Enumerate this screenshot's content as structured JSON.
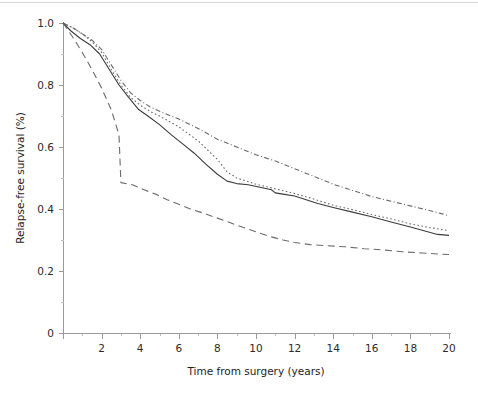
{
  "figure": {
    "background_color": "#ffffff",
    "axis_color": "#9a9a9a",
    "text_color": "#1d1d1d"
  },
  "axes": {
    "x_title": "Time from surgery (years)",
    "y_title": "Relapse-free survival (%)",
    "x_tick_labels": [
      "0",
      "2",
      "4",
      "6",
      "8",
      "10",
      "12",
      "14",
      "16",
      "18",
      "20"
    ],
    "y_tick_labels": [
      "0",
      "0.2",
      "0.4",
      "0.6",
      "0.8",
      "1.0"
    ]
  },
  "chart_data": {
    "type": "line",
    "title": "",
    "xlabel": "Time from surgery (years)",
    "ylabel": "Relapse-free survival (%)",
    "xlim": [
      0,
      20
    ],
    "ylim": [
      0,
      1.0
    ],
    "xticks": [
      0,
      2,
      4,
      6,
      8,
      10,
      12,
      14,
      16,
      18,
      20
    ],
    "yticks": [
      0,
      0.2,
      0.4,
      0.6,
      0.8,
      1.0
    ],
    "x_minor_ticks": [
      1,
      3,
      5,
      7,
      9,
      11,
      13,
      15,
      17,
      19
    ],
    "y_minor_ticks": [
      0.1,
      0.3,
      0.5,
      0.7,
      0.9
    ],
    "grid": false,
    "legend": "none",
    "legend_position": "none",
    "annotations": [],
    "series": [
      {
        "name": "series-1-dash-dot",
        "linestyle": "dashdot",
        "color": "#6a6a6a",
        "points": [
          [
            0.0,
            1.0
          ],
          [
            0.5,
            0.985
          ],
          [
            1.0,
            0.965
          ],
          [
            1.5,
            0.945
          ],
          [
            2.0,
            0.915
          ],
          [
            2.5,
            0.865
          ],
          [
            3.0,
            0.815
          ],
          [
            3.5,
            0.775
          ],
          [
            4.0,
            0.75
          ],
          [
            4.5,
            0.73
          ],
          [
            5.0,
            0.715
          ],
          [
            6.0,
            0.69
          ],
          [
            7.0,
            0.66
          ],
          [
            8.0,
            0.625
          ],
          [
            9.0,
            0.6
          ],
          [
            10.0,
            0.575
          ],
          [
            11.0,
            0.555
          ],
          [
            12.0,
            0.53
          ],
          [
            13.0,
            0.505
          ],
          [
            14.0,
            0.48
          ],
          [
            15.0,
            0.46
          ],
          [
            16.0,
            0.44
          ],
          [
            17.0,
            0.425
          ],
          [
            18.0,
            0.41
          ],
          [
            19.0,
            0.395
          ],
          [
            19.6,
            0.385
          ],
          [
            20.0,
            0.378
          ]
        ]
      },
      {
        "name": "series-2-dotted",
        "linestyle": "dotted",
        "color": "#6a6a6a",
        "points": [
          [
            0.0,
            1.0
          ],
          [
            0.5,
            0.985
          ],
          [
            1.0,
            0.965
          ],
          [
            1.5,
            0.94
          ],
          [
            2.0,
            0.905
          ],
          [
            2.5,
            0.85
          ],
          [
            3.0,
            0.8
          ],
          [
            3.5,
            0.76
          ],
          [
            4.0,
            0.735
          ],
          [
            4.5,
            0.715
          ],
          [
            5.0,
            0.7
          ],
          [
            6.0,
            0.665
          ],
          [
            7.0,
            0.62
          ],
          [
            8.0,
            0.56
          ],
          [
            8.5,
            0.52
          ],
          [
            9.0,
            0.5
          ],
          [
            10.0,
            0.48
          ],
          [
            11.0,
            0.465
          ],
          [
            12.0,
            0.45
          ],
          [
            13.0,
            0.432
          ],
          [
            14.0,
            0.412
          ],
          [
            15.0,
            0.398
          ],
          [
            16.0,
            0.382
          ],
          [
            17.0,
            0.368
          ],
          [
            18.0,
            0.352
          ],
          [
            19.0,
            0.34
          ],
          [
            20.0,
            0.33
          ]
        ]
      },
      {
        "name": "series-3-solid",
        "linestyle": "solid",
        "color": "#3c3c3c",
        "points": [
          [
            0.0,
            1.0
          ],
          [
            0.4,
            0.975
          ],
          [
            0.9,
            0.95
          ],
          [
            1.4,
            0.93
          ],
          [
            1.9,
            0.9
          ],
          [
            2.4,
            0.85
          ],
          [
            2.9,
            0.8
          ],
          [
            3.4,
            0.76
          ],
          [
            3.9,
            0.722
          ],
          [
            4.4,
            0.7
          ],
          [
            5.0,
            0.672
          ],
          [
            5.6,
            0.64
          ],
          [
            6.2,
            0.61
          ],
          [
            6.8,
            0.58
          ],
          [
            7.4,
            0.545
          ],
          [
            8.0,
            0.512
          ],
          [
            8.5,
            0.49
          ],
          [
            9.0,
            0.482
          ],
          [
            9.6,
            0.478
          ],
          [
            10.2,
            0.47
          ],
          [
            10.8,
            0.462
          ],
          [
            11.0,
            0.452
          ],
          [
            11.4,
            0.448
          ],
          [
            12.0,
            0.442
          ],
          [
            12.6,
            0.43
          ],
          [
            13.2,
            0.418
          ],
          [
            14.0,
            0.405
          ],
          [
            15.0,
            0.39
          ],
          [
            16.0,
            0.375
          ],
          [
            17.0,
            0.358
          ],
          [
            18.0,
            0.342
          ],
          [
            18.8,
            0.328
          ],
          [
            19.4,
            0.318
          ],
          [
            20.0,
            0.315
          ]
        ]
      },
      {
        "name": "series-4-dashed",
        "linestyle": "dashed",
        "color": "#6a6a6a",
        "points": [
          [
            0.0,
            1.0
          ],
          [
            0.5,
            0.955
          ],
          [
            1.0,
            0.905
          ],
          [
            1.5,
            0.85
          ],
          [
            2.0,
            0.79
          ],
          [
            2.5,
            0.72
          ],
          [
            2.9,
            0.64
          ],
          [
            3.0,
            0.485
          ],
          [
            3.6,
            0.478
          ],
          [
            4.2,
            0.462
          ],
          [
            4.8,
            0.448
          ],
          [
            5.4,
            0.43
          ],
          [
            6.0,
            0.415
          ],
          [
            6.6,
            0.4
          ],
          [
            7.2,
            0.388
          ],
          [
            7.8,
            0.375
          ],
          [
            8.4,
            0.362
          ],
          [
            9.0,
            0.348
          ],
          [
            9.6,
            0.335
          ],
          [
            10.2,
            0.322
          ],
          [
            10.8,
            0.31
          ],
          [
            11.4,
            0.3
          ],
          [
            12.0,
            0.292
          ],
          [
            12.8,
            0.285
          ],
          [
            13.6,
            0.282
          ],
          [
            14.6,
            0.278
          ],
          [
            15.6,
            0.272
          ],
          [
            16.6,
            0.268
          ],
          [
            17.6,
            0.262
          ],
          [
            18.6,
            0.258
          ],
          [
            19.4,
            0.255
          ],
          [
            20.0,
            0.253
          ]
        ]
      }
    ]
  }
}
